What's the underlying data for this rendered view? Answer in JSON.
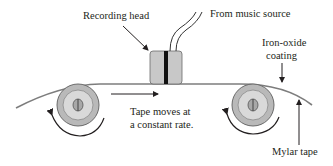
{
  "labels": {
    "recording_head": "Recording head",
    "music_source": "From music source",
    "coating_line1": "Iron-oxide",
    "coating_line2": "coating",
    "tape_moves_line1": "Tape moves at",
    "tape_moves_line2": "a constant rate.",
    "mylar": "Mylar tape"
  },
  "colors": {
    "tape": "#7d7d7d",
    "reel_outer": "#b9b9b9",
    "reel_inner": "#d9d9d9",
    "head_body": "#c8c8c8",
    "head_gap": "#111111",
    "arrow": "#231f20"
  }
}
